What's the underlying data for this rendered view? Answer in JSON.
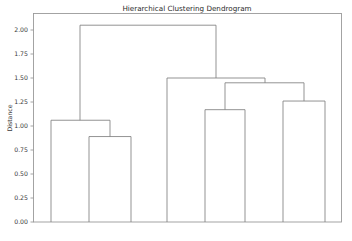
{
  "chart_data": {
    "type": "line",
    "title": "Hierarchical Clustering Dendrogram",
    "xlabel": "",
    "ylabel": "Distance",
    "ylim": [
      0.0,
      2.16
    ],
    "xlim": [
      0,
      352
    ],
    "grid": false,
    "legend": null,
    "yticks": [
      "0.00",
      "0.25",
      "0.50",
      "0.75",
      "1.00",
      "1.25",
      "1.50",
      "1.75",
      "2.00"
    ],
    "ytick_values": [
      0.0,
      0.25,
      0.5,
      0.75,
      1.0,
      1.25,
      1.5,
      1.75,
      2.0
    ],
    "xticks": [],
    "leaf_count": 9,
    "leaf_positions": [
      51,
      89,
      113,
      131,
      167,
      205,
      245,
      283,
      325
    ],
    "link_color": "#808080",
    "axis_color": "#9a9a9a",
    "text_color": "#3b3b3b",
    "background": "#ffffff",
    "merges": [
      {
        "id": "m1",
        "label": "merge-0.89",
        "height": 0.89,
        "left_x": 89,
        "right_x": 131,
        "left_height": 0.0,
        "right_height": 0.0
      },
      {
        "id": "m2",
        "label": "merge-1.06",
        "height": 1.06,
        "left_x": 51,
        "right_x": 110,
        "left_height": 0.0,
        "right_height": 0.89
      },
      {
        "id": "m3",
        "label": "merge-1.17",
        "height": 1.17,
        "left_x": 205,
        "right_x": 245,
        "left_height": 0.0,
        "right_height": 0.0
      },
      {
        "id": "m4",
        "label": "merge-1.26",
        "height": 1.26,
        "left_x": 283,
        "right_x": 325,
        "left_height": 0.0,
        "right_height": 0.0
      },
      {
        "id": "m5",
        "label": "merge-1.45",
        "height": 1.45,
        "left_x": 225,
        "right_x": 304,
        "left_height": 1.17,
        "right_height": 1.26
      },
      {
        "id": "m6",
        "label": "merge-1.50",
        "height": 1.5,
        "left_x": 167,
        "right_x": 265,
        "left_height": 0.0,
        "right_height": 1.45
      },
      {
        "id": "m7",
        "label": "merge-2.05",
        "height": 2.05,
        "left_x": 80,
        "right_x": 216,
        "left_height": 1.06,
        "right_height": 1.5
      }
    ]
  },
  "axes": {
    "ylabel": "Distance",
    "title": "Hierarchical Clustering Dendrogram"
  }
}
